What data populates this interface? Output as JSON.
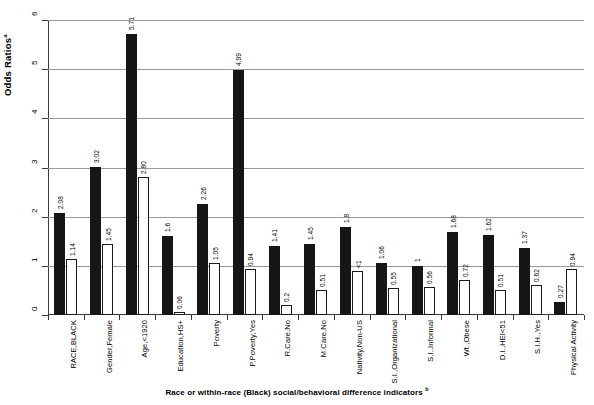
{
  "chart_data": {
    "type": "bar",
    "title": "",
    "ylabel": "Odds Ratios",
    "ylabel_sup": "a",
    "xlabel": "Race or within-race (Black) social/behavioral difference indicators",
    "xlabel_sup": "b",
    "ylim": [
      0,
      6
    ],
    "yticks": [
      0,
      1,
      2,
      3,
      4,
      5,
      6
    ],
    "ytick_labels": [
      "0",
      "1",
      "2",
      "3",
      "4",
      "5",
      "6"
    ],
    "grid": true,
    "legend": "none",
    "categories": [
      "RACE,BLACK",
      "Gender,Female",
      "Age,<1920",
      "Education,HS+",
      "Poverty",
      "P.Poverty,Yes",
      "R.Care,No",
      "M.Care,No",
      "Nativity,Non-US",
      "S.I.,Organizational",
      "S.I.,Informal",
      "Wt.,Obese",
      "D.I.,HEI<51",
      "S.I.H.,Yes",
      "Physical Activity"
    ],
    "series": [
      {
        "name": "series-dark",
        "style": "filled-black",
        "values": [
          2.08,
          3.02,
          5.71,
          1.6,
          2.26,
          4.99,
          1.41,
          1.45,
          1.8,
          1.06,
          1,
          1.68,
          1.62,
          1.37,
          0.27
        ],
        "labels": [
          "2.08",
          "3.02",
          "5.71",
          "1.6",
          "2.26",
          "4.99",
          "1.41",
          "1.45",
          "1.8",
          "1.06",
          "1",
          "1.68",
          "1.62",
          "1.37",
          "0.27"
        ]
      },
      {
        "name": "series-light",
        "style": "outlined-white",
        "values": [
          1.14,
          1.45,
          2.8,
          0.06,
          1.05,
          0.94,
          0.2,
          0.51,
          0.9,
          0.55,
          0.56,
          0.72,
          0.51,
          0.62,
          0.94
        ],
        "labels": [
          "1.14",
          "1.45",
          "2.80",
          "0.06",
          "1.05",
          "0.94",
          "0.2",
          "0.51",
          "<1",
          "0.55",
          "0.56",
          "0.72",
          "0.51",
          "0.62",
          "0.94"
        ]
      }
    ]
  }
}
